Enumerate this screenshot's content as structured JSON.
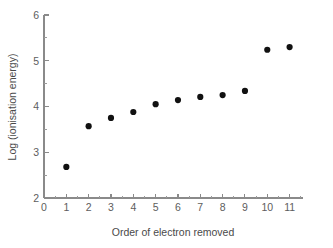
{
  "chart_data": {
    "type": "scatter",
    "title": "",
    "xlabel": "Order of electron removed",
    "ylabel": "Log (ionisation energy)",
    "x": [
      1,
      2,
      3,
      4,
      5,
      6,
      7,
      8,
      9,
      10,
      11
    ],
    "values": [
      2.68,
      3.57,
      3.75,
      3.88,
      4.05,
      4.14,
      4.21,
      4.25,
      4.34,
      5.24,
      5.3
    ],
    "xlim": [
      0,
      11.6
    ],
    "ylim": [
      2,
      6
    ],
    "x_ticks": [
      0,
      1,
      2,
      3,
      4,
      5,
      6,
      7,
      8,
      9,
      10,
      11
    ],
    "x_tick_labels": [
      "0",
      "1",
      "2",
      "3",
      "4",
      "5",
      "6",
      "7",
      "8",
      "9",
      "10",
      "11"
    ],
    "y_ticks": [
      2,
      3,
      4,
      5,
      6
    ],
    "y_tick_labels": [
      "2",
      "3",
      "4",
      "5",
      "6"
    ],
    "y_minor_ticks": [
      2.5,
      3.5,
      4.5,
      5.5
    ],
    "grid": false,
    "legend": null,
    "marker_color": "#111111",
    "axis_color": "#8a8a8a",
    "text_color": "#5d5d5d"
  }
}
